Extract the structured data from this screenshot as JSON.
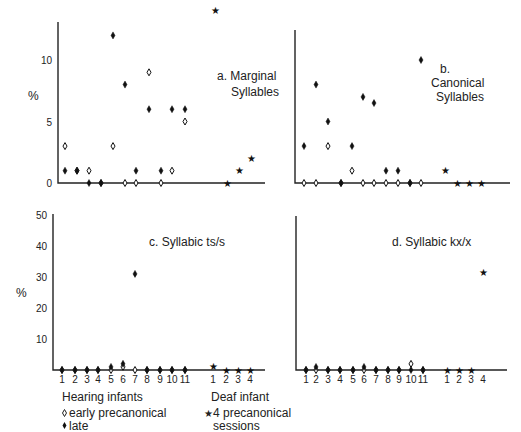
{
  "chart_data": [
    {
      "type": "scatter",
      "panel": "a",
      "title": "a.  Marginal Syllables",
      "title_lines": [
        "a.  Marginal",
        "Syllables"
      ],
      "ylabel": "%",
      "ylim": [
        0,
        14
      ],
      "yticks": [
        0,
        5,
        10
      ],
      "x_categories_hearing": [
        "1",
        "2",
        "3",
        "4",
        "5",
        "6",
        "7",
        "8",
        "9",
        "10",
        "11"
      ],
      "x_categories_deaf": [
        "1",
        "2",
        "3",
        "4"
      ],
      "show_xtick_labels": false,
      "series": [
        {
          "name": "early precanonical",
          "marker": "open-diamond",
          "values": [
            3,
            1,
            1,
            0,
            3,
            0,
            0,
            9,
            0,
            1,
            5
          ]
        },
        {
          "name": "late",
          "marker": "filled-diamond",
          "values": [
            1,
            1,
            0,
            0,
            12,
            8,
            1,
            6,
            1,
            6,
            6
          ]
        },
        {
          "name": "4 precanonical sessions",
          "marker": "star",
          "values": [
            14,
            0,
            1,
            2
          ]
        }
      ]
    },
    {
      "type": "scatter",
      "panel": "b",
      "title": "b. Canonical Syllables",
      "title_lines": [
        "b.",
        "Canonical",
        "Syllables"
      ],
      "ylabel": "",
      "ylim": [
        0,
        14
      ],
      "yticks": [],
      "x_categories_hearing": [
        "1",
        "2",
        "3",
        "4",
        "5",
        "6",
        "7",
        "8",
        "9",
        "10",
        "11"
      ],
      "x_categories_deaf": [
        "1",
        "2",
        "3",
        "4"
      ],
      "show_xtick_labels": false,
      "series": [
        {
          "name": "early precanonical",
          "marker": "open-diamond",
          "values": [
            0,
            0,
            3,
            0,
            1,
            0,
            0,
            0,
            0,
            0,
            0
          ]
        },
        {
          "name": "late",
          "marker": "filled-diamond",
          "values": [
            3,
            8,
            5,
            0,
            3,
            7,
            6.5,
            1,
            1,
            0,
            10
          ]
        },
        {
          "name": "4 precanonical sessions",
          "marker": "star",
          "values": [
            1,
            0,
            0,
            0
          ]
        }
      ]
    },
    {
      "type": "scatter",
      "panel": "c",
      "title": "c.  Syllabic ts/s",
      "title_lines": [
        "c.  Syllabic ts/s"
      ],
      "ylabel": "%",
      "ylim": [
        0,
        50
      ],
      "yticks": [
        10,
        20,
        30,
        40,
        50
      ],
      "x_categories_hearing": [
        "1",
        "2",
        "3",
        "4",
        "5",
        "6",
        "7",
        "8",
        "9",
        "10",
        "11"
      ],
      "x_categories_deaf": [
        "1",
        "2",
        "3",
        "4"
      ],
      "show_xtick_labels": true,
      "series": [
        {
          "name": "early precanonical",
          "marker": "open-diamond",
          "values": [
            0,
            0,
            0,
            0,
            0,
            1,
            0,
            0,
            0,
            0,
            0
          ]
        },
        {
          "name": "late",
          "marker": "filled-diamond",
          "values": [
            0,
            0,
            0,
            0,
            1,
            2,
            31,
            0,
            0,
            0,
            0
          ]
        },
        {
          "name": "4 precanonical sessions",
          "marker": "star",
          "values": [
            1,
            0,
            0,
            0
          ]
        }
      ]
    },
    {
      "type": "scatter",
      "panel": "d",
      "title": "d.  Syllabic kx/x",
      "title_lines": [
        "d.  Syllabic kx/x"
      ],
      "ylabel": "",
      "ylim": [
        0,
        50
      ],
      "yticks": [],
      "x_categories_hearing": [
        "1",
        "2",
        "3",
        "4",
        "5",
        "6",
        "7",
        "8",
        "9",
        "10",
        "11"
      ],
      "x_categories_deaf": [
        "1",
        "2",
        "3",
        "4"
      ],
      "show_xtick_labels": true,
      "series": [
        {
          "name": "early precanonical",
          "marker": "open-diamond",
          "values": [
            0,
            0,
            0,
            0,
            0,
            0,
            0,
            0,
            0,
            2,
            0
          ]
        },
        {
          "name": "late",
          "marker": "filled-diamond",
          "values": [
            0,
            1,
            0,
            0,
            0,
            1,
            0,
            0,
            0,
            0,
            0
          ]
        },
        {
          "name": "4 precanonical sessions",
          "marker": "star",
          "values": [
            0,
            0,
            0,
            32
          ]
        }
      ]
    }
  ],
  "legend": {
    "hearing_title": "Hearing infants",
    "hearing_early": "early precanonical",
    "hearing_late": "late",
    "deaf_title": "Deaf infant",
    "deaf_sessions_line1": "4 precanonical",
    "deaf_sessions_line2": "sessions"
  }
}
